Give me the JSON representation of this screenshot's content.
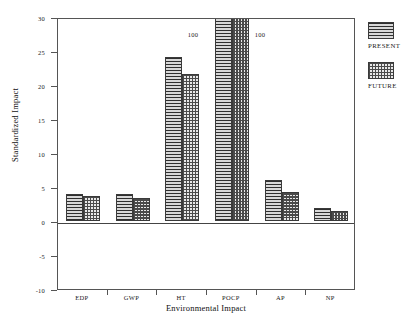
{
  "chart_data": {
    "type": "bar",
    "title": "",
    "subtitle": "",
    "xlabel": "Environmental Impact",
    "ylabel": "Standardized Impact",
    "categories": [
      "EDP",
      "GWP",
      "HT",
      "POCP",
      "AP",
      "NP"
    ],
    "series": [
      {
        "name": "PRESENT",
        "values": [
          4.0,
          3.9,
          24.1,
          100,
          6.0,
          1.9
        ]
      },
      {
        "name": "FUTURE",
        "values": [
          3.7,
          3.4,
          21.6,
          100,
          4.2,
          1.5
        ]
      }
    ],
    "ylim": [
      -10,
      30
    ],
    "yticks": [
      30,
      25,
      20,
      15,
      10,
      5,
      0,
      -5,
      -10
    ],
    "ytick_labels": [
      "30",
      "25",
      "20",
      "15",
      "10",
      "5",
      "0",
      "-5",
      "-10"
    ],
    "grid": false,
    "legend_position": "right",
    "annotations": [
      {
        "text": "100",
        "category": "POCP",
        "series": "PRESENT",
        "side": "left"
      },
      {
        "text": "100",
        "category": "POCP",
        "series": "FUTURE",
        "side": "right"
      }
    ],
    "clipped_note": "POCP bars exceed the axis maximum of 30 and are clipped at the plot top; their true value is 100.",
    "colors": {
      "present_fill": "#8d8d8d",
      "future_fill": "#e8e8e8",
      "bar_outline": "#3a3a3a",
      "axis": "#555555",
      "text": "#1a1a1a"
    }
  },
  "legend": {
    "entries": [
      {
        "label": "PRESENT",
        "pattern": "horizontal-lines"
      },
      {
        "label": "FUTURE",
        "pattern": "checkerboard"
      }
    ]
  }
}
